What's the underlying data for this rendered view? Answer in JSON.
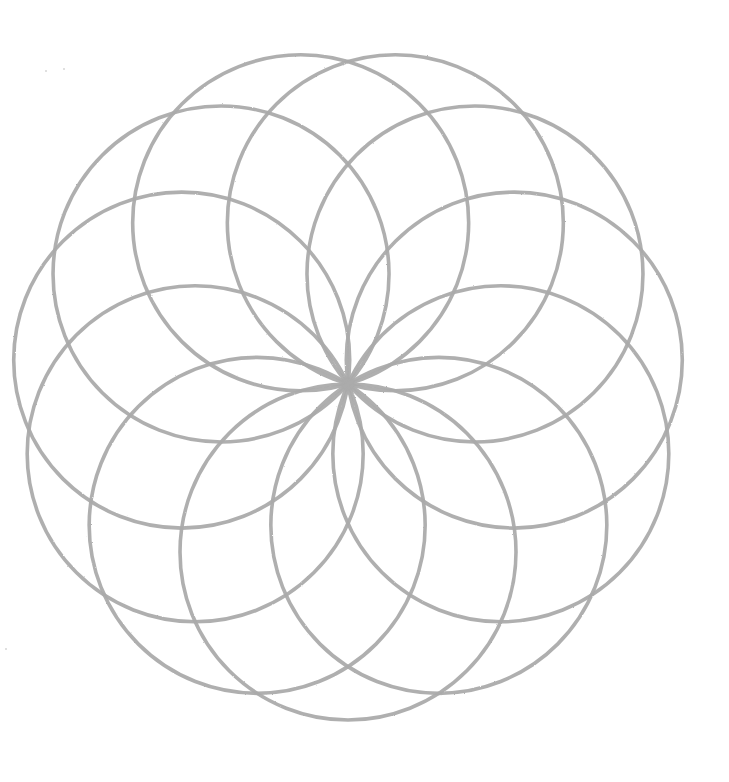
{
  "drawing": {
    "subject": "Pencil-drawn circle rosette (overlapping circles through a common center)",
    "canvas": {
      "width": 729,
      "height": 782,
      "background": "#ffffff"
    },
    "rosette": {
      "center": [
        348,
        384
      ],
      "circle_count": 11,
      "circle_radius": 168,
      "start_angle_deg": 90,
      "stroke_color": "#ababab",
      "stroke_width": 3.6,
      "opacity": 0.95
    },
    "specks": [
      {
        "x": 45,
        "y": 70
      },
      {
        "x": 63,
        "y": 68
      },
      {
        "x": 5,
        "y": 648
      }
    ]
  }
}
